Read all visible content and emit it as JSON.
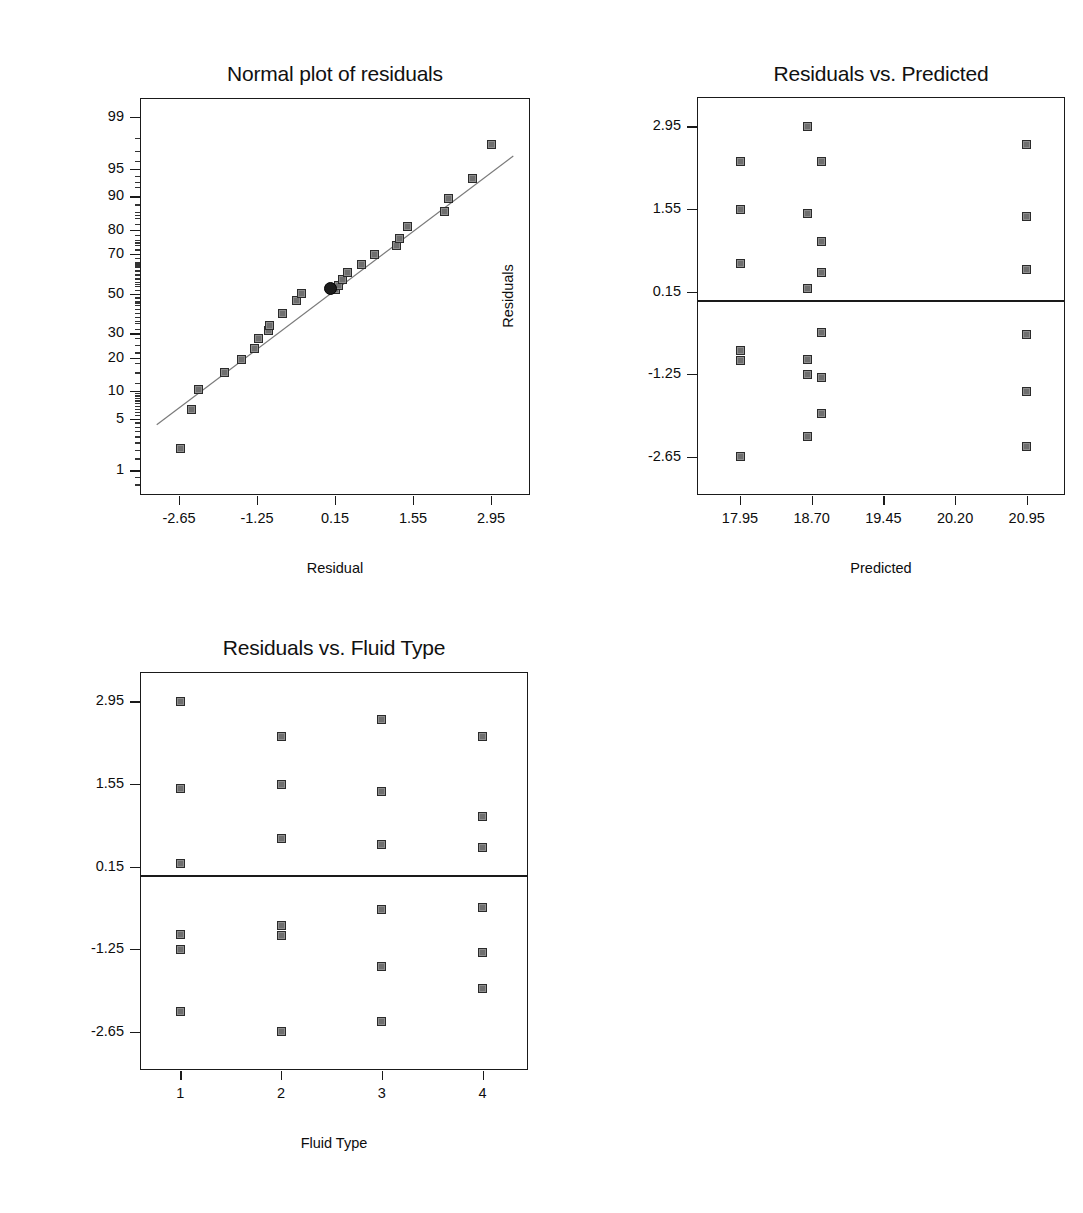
{
  "page": {
    "background": "#ffffff",
    "marker_fill": "#8e8e8e",
    "marker_stroke": "#2b2b2b",
    "line_color": "#7a7a7a",
    "frame_color": "#1a1a1a"
  },
  "chart_data": [
    {
      "id": "normal-plot",
      "type": "scatter",
      "title": "Normal plot of residuals",
      "xlabel": "Residual",
      "ylabel": "Normal % probability",
      "xlim": [
        -3.35,
        3.65
      ],
      "xticks": [
        -2.65,
        -1.25,
        0.15,
        1.55,
        2.95
      ],
      "xticklabels": [
        "-2.65",
        "-1.25",
        "0.15",
        "1.55",
        "2.95"
      ],
      "yscale": "normal-probability",
      "yticks": [
        1,
        5,
        10,
        20,
        30,
        50,
        70,
        80,
        90,
        95,
        99
      ],
      "yticklabels": [
        "1",
        "5",
        "10",
        "20",
        "30",
        "50",
        "70",
        "80",
        "90",
        "95",
        "99"
      ],
      "grid": false,
      "legend": null,
      "reference_line": {
        "type": "fit-line",
        "x0": -3.05,
        "y0": 4.2,
        "x1": 3.35,
        "y1": 96.5
      },
      "points": [
        {
          "x": -2.62,
          "y": 2.1
        },
        {
          "x": -2.42,
          "y": 6.3
        },
        {
          "x": -2.3,
          "y": 10.4
        },
        {
          "x": -1.83,
          "y": 15.0
        },
        {
          "x": -1.52,
          "y": 19.2
        },
        {
          "x": -1.3,
          "y": 23.5
        },
        {
          "x": -1.22,
          "y": 27.8
        },
        {
          "x": -1.05,
          "y": 31.5
        },
        {
          "x": -1.03,
          "y": 33.5
        },
        {
          "x": -0.8,
          "y": 39.5
        },
        {
          "x": -0.55,
          "y": 46.5
        },
        {
          "x": -0.45,
          "y": 50.0
        },
        {
          "x": 0.15,
          "y": 52.0
        },
        {
          "x": 0.22,
          "y": 54.0
        },
        {
          "x": 0.28,
          "y": 57.5
        },
        {
          "x": 0.38,
          "y": 61.0
        },
        {
          "x": 0.62,
          "y": 65.0
        },
        {
          "x": 0.86,
          "y": 69.5
        },
        {
          "x": 1.25,
          "y": 73.5
        },
        {
          "x": 1.3,
          "y": 76.5
        },
        {
          "x": 1.45,
          "y": 81.0
        },
        {
          "x": 2.12,
          "y": 86.0
        },
        {
          "x": 2.18,
          "y": 89.5
        },
        {
          "x": 2.62,
          "y": 93.5
        },
        {
          "x": 2.95,
          "y": 97.5
        }
      ],
      "highlighted_point": {
        "x": 0.15,
        "y": 52.0,
        "style": "filled-circle"
      }
    },
    {
      "id": "residuals-vs-predicted",
      "type": "scatter",
      "title": "Residuals vs. Predicted",
      "xlabel": "Predicted",
      "ylabel": "Residuals",
      "xlim": [
        17.5,
        21.35
      ],
      "xticks": [
        17.95,
        18.7,
        19.45,
        20.2,
        20.95
      ],
      "xticklabels": [
        "17.95",
        "18.70",
        "19.45",
        "20.20",
        "20.95"
      ],
      "ylim": [
        -3.3,
        3.45
      ],
      "yticks": [
        -2.65,
        -1.25,
        0.15,
        1.55,
        2.95
      ],
      "yticklabels": [
        "-2.65",
        "-1.25",
        "0.15",
        "1.55",
        "2.95"
      ],
      "grid": false,
      "legend": null,
      "reference_line": {
        "type": "horizontal",
        "y": 0.0
      },
      "points": [
        {
          "x": 17.95,
          "y": 2.35
        },
        {
          "x": 17.95,
          "y": 1.55
        },
        {
          "x": 17.95,
          "y": 0.62
        },
        {
          "x": 17.95,
          "y": -0.85
        },
        {
          "x": 17.95,
          "y": -1.02
        },
        {
          "x": 17.95,
          "y": -2.65
        },
        {
          "x": 18.66,
          "y": 2.95
        },
        {
          "x": 18.66,
          "y": 1.48
        },
        {
          "x": 18.66,
          "y": 0.2
        },
        {
          "x": 18.66,
          "y": -1.0
        },
        {
          "x": 18.66,
          "y": -1.25
        },
        {
          "x": 18.66,
          "y": -2.3
        },
        {
          "x": 18.8,
          "y": 2.35
        },
        {
          "x": 18.8,
          "y": 1.0
        },
        {
          "x": 18.8,
          "y": 0.48
        },
        {
          "x": 18.8,
          "y": -0.55
        },
        {
          "x": 18.8,
          "y": -1.3
        },
        {
          "x": 18.8,
          "y": -1.92
        },
        {
          "x": 20.95,
          "y": 2.65
        },
        {
          "x": 20.95,
          "y": 1.42
        },
        {
          "x": 20.95,
          "y": 0.52
        },
        {
          "x": 20.95,
          "y": -0.58
        },
        {
          "x": 20.95,
          "y": -1.55
        },
        {
          "x": 20.95,
          "y": -2.48
        }
      ]
    },
    {
      "id": "residuals-vs-fluid-type",
      "type": "scatter",
      "title": "Residuals vs. Fluid Type",
      "xlabel": "Fluid Type",
      "ylabel": "Residuals",
      "xlim": [
        0.6,
        4.45
      ],
      "xticks": [
        1,
        2,
        3,
        4
      ],
      "xticklabels": [
        "1",
        "2",
        "3",
        "4"
      ],
      "ylim": [
        -3.3,
        3.45
      ],
      "yticks": [
        -2.65,
        -1.25,
        0.15,
        1.55,
        2.95
      ],
      "yticklabels": [
        "-2.65",
        "-1.25",
        "0.15",
        "1.55",
        "2.95"
      ],
      "grid": false,
      "legend": null,
      "reference_line": {
        "type": "horizontal",
        "y": 0.0
      },
      "points": [
        {
          "x": 1,
          "y": 2.95
        },
        {
          "x": 1,
          "y": 1.48
        },
        {
          "x": 1,
          "y": 0.2
        },
        {
          "x": 1,
          "y": -1.0
        },
        {
          "x": 1,
          "y": -1.25
        },
        {
          "x": 1,
          "y": -2.3
        },
        {
          "x": 2,
          "y": 2.35
        },
        {
          "x": 2,
          "y": 1.55
        },
        {
          "x": 2,
          "y": 0.62
        },
        {
          "x": 2,
          "y": -0.85
        },
        {
          "x": 2,
          "y": -1.02
        },
        {
          "x": 2,
          "y": -2.65
        },
        {
          "x": 3,
          "y": 2.65
        },
        {
          "x": 3,
          "y": 1.42
        },
        {
          "x": 3,
          "y": 0.52
        },
        {
          "x": 3,
          "y": -0.58
        },
        {
          "x": 3,
          "y": -1.55
        },
        {
          "x": 3,
          "y": -2.48
        },
        {
          "x": 4,
          "y": 2.35
        },
        {
          "x": 4,
          "y": 1.0
        },
        {
          "x": 4,
          "y": 0.48
        },
        {
          "x": 4,
          "y": -0.55
        },
        {
          "x": 4,
          "y": -1.3
        },
        {
          "x": 4,
          "y": -1.92
        }
      ]
    }
  ]
}
